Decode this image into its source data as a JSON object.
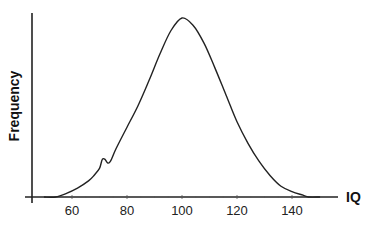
{
  "chart_data": {
    "type": "line",
    "title": "",
    "xlabel": "IQ",
    "ylabel": "Frequency",
    "x_ticks": [
      60,
      80,
      100,
      120,
      140
    ],
    "xlim": [
      45,
      157
    ],
    "y_ticks": [],
    "grid": false,
    "legend": null,
    "series": [
      {
        "name": "IQ distribution",
        "description": "Bell-shaped (normal) curve centered at IQ 100 with a small bump near IQ 70",
        "x": [
          50,
          54,
          58,
          62,
          66,
          68,
          70,
          71,
          72,
          73,
          74,
          76,
          80,
          84,
          88,
          92,
          96,
          100,
          104,
          108,
          112,
          116,
          120,
          124,
          128,
          132,
          136,
          140,
          144,
          146,
          150
        ],
        "y": [
          0.0,
          0.0,
          0.02,
          0.05,
          0.09,
          0.12,
          0.16,
          0.21,
          0.21,
          0.19,
          0.2,
          0.27,
          0.39,
          0.51,
          0.65,
          0.8,
          0.93,
          1.0,
          0.96,
          0.86,
          0.72,
          0.57,
          0.42,
          0.3,
          0.2,
          0.12,
          0.06,
          0.03,
          0.01,
          0.0,
          0.0
        ]
      }
    ],
    "colors": {
      "curve": "#222222",
      "axes": "#222222"
    }
  }
}
